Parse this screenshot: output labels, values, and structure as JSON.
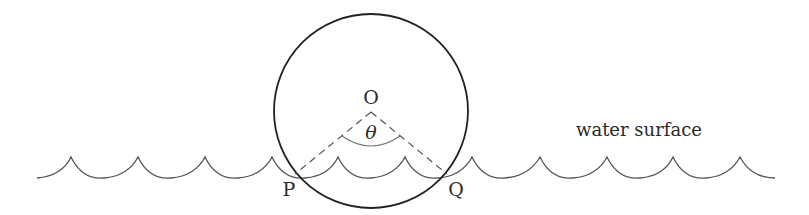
{
  "diagram": {
    "labels": {
      "center": "O",
      "angle": "θ",
      "left_point": "P",
      "right_point": "Q",
      "surface": "water surface"
    },
    "colors": {
      "stroke": "#2a2a2a",
      "wave": "#555555",
      "dashed": "#555555",
      "arc": "#777777"
    }
  }
}
